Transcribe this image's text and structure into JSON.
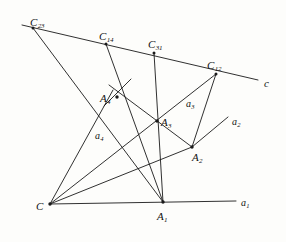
{
  "figure": {
    "background_color": "#fdfdfb",
    "ink_color": "#1a1a1a",
    "labels": {
      "c23": {
        "base": "C",
        "sub": "23"
      },
      "c14": {
        "base": "C",
        "sub": "14"
      },
      "c31": {
        "base": "C",
        "sub": "31"
      },
      "c12": {
        "base": "C",
        "sub": "12"
      },
      "line_c": {
        "base": "c",
        "sub": ""
      },
      "a4_point": {
        "base": "A",
        "sub": "4"
      },
      "a3_point": {
        "base": "A",
        "sub": "3"
      },
      "a2_point": {
        "base": "A",
        "sub": "2"
      },
      "a1_point": {
        "base": "A",
        "sub": "1"
      },
      "center_c": {
        "base": "C",
        "sub": ""
      },
      "a4_line": {
        "base": "a",
        "sub": "4"
      },
      "a3_line": {
        "base": "a",
        "sub": "3"
      },
      "a2_line": {
        "base": "a",
        "sub": "2"
      },
      "a1_line": {
        "base": "a",
        "sub": "1"
      }
    },
    "points": {
      "C": {
        "x": 50,
        "y": 204
      },
      "A1": {
        "x": 163,
        "y": 202
      },
      "A2": {
        "x": 192,
        "y": 147
      },
      "A3": {
        "x": 157,
        "y": 121
      },
      "A4": {
        "x": 117,
        "y": 97
      },
      "C23": {
        "x": 33,
        "y": 28
      },
      "C14": {
        "x": 106,
        "y": 44
      },
      "C31": {
        "x": 154,
        "y": 53
      },
      "C12": {
        "x": 216,
        "y": 74
      },
      "c_end": {
        "x": 258,
        "y": 80
      },
      "a1_end": {
        "x": 236,
        "y": 201
      },
      "a2_end": {
        "x": 228,
        "y": 117
      }
    },
    "segments": [
      {
        "name": "line-c",
        "from": "C23",
        "to": "c_end"
      },
      {
        "name": "axis-a1",
        "from": "C",
        "to": "a1_end"
      },
      {
        "name": "ray-C-to-A4",
        "from": "C",
        "to": "A4"
      },
      {
        "name": "ray-C-to-C12",
        "from": "C",
        "to": "C12"
      },
      {
        "name": "ray-C-to-A2",
        "from": "C",
        "to": "A2"
      },
      {
        "name": "seg-C23-to-A1",
        "from": "C23",
        "to": "A1"
      },
      {
        "name": "seg-C14-to-A1",
        "from": "C14",
        "to": "A1"
      },
      {
        "name": "seg-C31-to-A1",
        "from": "C31",
        "to": "A1"
      },
      {
        "name": "seg-A4-to-A2",
        "from": "A4",
        "to": "A2"
      },
      {
        "name": "seg-C12-to-A2",
        "from": "C12",
        "to": "A2"
      },
      {
        "name": "ray-A2-to-a2",
        "from": "A2",
        "to": "a2_end"
      },
      {
        "name": "seg-A3-overshoot",
        "from": "A4",
        "to": "A3"
      }
    ]
  }
}
